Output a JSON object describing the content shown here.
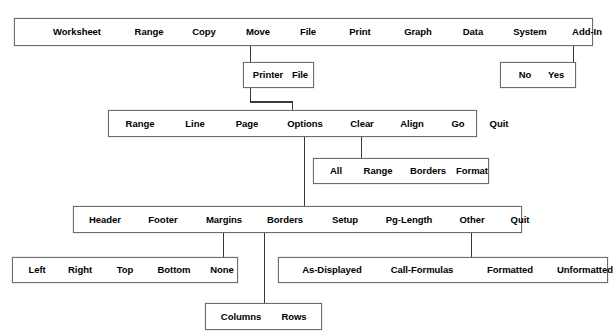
{
  "diagram": {
    "type": "menu-tree",
    "background_color": "#ffffff",
    "line_color": "#3a3a3a",
    "border_color": "#6d6d6d",
    "text_color": "#000000",
    "faint_header": "",
    "rows": [
      {
        "id": "main-menu",
        "name": "main-menu-bar",
        "x": 14,
        "y": 18,
        "width": 579,
        "height": 28,
        "items": [
          {
            "label": "Worksheet",
            "cx": 62
          },
          {
            "label": "Range",
            "cx": 134
          },
          {
            "label": "Copy",
            "cx": 189
          },
          {
            "label": "Move",
            "cx": 243
          },
          {
            "label": "File",
            "cx": 293
          },
          {
            "label": "Print",
            "cx": 345
          },
          {
            "label": "Graph",
            "cx": 403
          },
          {
            "label": "Data",
            "cx": 458
          },
          {
            "label": "System",
            "cx": 515
          },
          {
            "label": "Add-In",
            "cx": 572
          },
          {
            "label": "Quit",
            "cx": 621
          }
        ]
      },
      {
        "id": "print-destination",
        "name": "print-destination-menu",
        "x": 243,
        "y": 62,
        "width": 71,
        "height": 26,
        "items": [
          {
            "label": "Printer",
            "cx": 24
          },
          {
            "label": "File",
            "cx": 56
          }
        ]
      },
      {
        "id": "quit-confirm",
        "name": "quit-confirm-menu",
        "x": 500,
        "y": 62,
        "width": 76,
        "height": 26,
        "items": [
          {
            "label": "No",
            "cx": 24
          },
          {
            "label": "Yes",
            "cx": 55
          }
        ]
      },
      {
        "id": "print-menu",
        "name": "print-settings-menu",
        "x": 108,
        "y": 110,
        "width": 369,
        "height": 27,
        "items": [
          {
            "label": "Range",
            "cx": 31
          },
          {
            "label": "Line",
            "cx": 86
          },
          {
            "label": "Page",
            "cx": 138
          },
          {
            "label": "Options",
            "cx": 196
          },
          {
            "label": "Clear",
            "cx": 253
          },
          {
            "label": "Align",
            "cx": 303
          },
          {
            "label": "Go",
            "cx": 349
          },
          {
            "label": "Quit",
            "cx": 390
          }
        ]
      },
      {
        "id": "clear-menu",
        "name": "clear-submenu",
        "x": 313,
        "y": 158,
        "width": 176,
        "height": 26,
        "items": [
          {
            "label": "All",
            "cx": 22
          },
          {
            "label": "Range",
            "cx": 64
          },
          {
            "label": "Borders",
            "cx": 114
          },
          {
            "label": "Format",
            "cx": 158
          }
        ]
      },
      {
        "id": "options-menu",
        "name": "options-submenu",
        "x": 73,
        "y": 206,
        "width": 449,
        "height": 27,
        "items": [
          {
            "label": "Header",
            "cx": 31
          },
          {
            "label": "Footer",
            "cx": 89
          },
          {
            "label": "Margins",
            "cx": 150
          },
          {
            "label": "Borders",
            "cx": 211
          },
          {
            "label": "Setup",
            "cx": 271
          },
          {
            "label": "Pg-Length",
            "cx": 335
          },
          {
            "label": "Other",
            "cx": 398
          },
          {
            "label": "Quit",
            "cx": 446
          }
        ]
      },
      {
        "id": "borders-margins-menu",
        "name": "margins-submenu",
        "x": 12,
        "y": 257,
        "width": 226,
        "height": 26,
        "items": [
          {
            "label": "Left",
            "cx": 24
          },
          {
            "label": "Right",
            "cx": 67
          },
          {
            "label": "Top",
            "cx": 112
          },
          {
            "label": "Bottom",
            "cx": 161
          },
          {
            "label": "None",
            "cx": 209
          }
        ]
      },
      {
        "id": "other-menu",
        "name": "other-submenu",
        "x": 278,
        "y": 257,
        "width": 330,
        "height": 26,
        "items": [
          {
            "label": "As-Displayed",
            "cx": 53
          },
          {
            "label": "Call-Formulas",
            "cx": 143
          },
          {
            "label": "Formatted",
            "cx": 231
          },
          {
            "label": "Unformatted",
            "cx": 306
          }
        ]
      },
      {
        "id": "borders-menu",
        "name": "borders-submenu",
        "x": 205,
        "y": 303,
        "width": 117,
        "height": 27,
        "items": [
          {
            "label": "Columns",
            "cx": 35
          },
          {
            "label": "Rows",
            "cx": 88
          }
        ]
      }
    ],
    "connectors": [
      {
        "name": "connector-print-to-destination",
        "from": "Print",
        "to": "Printer/File",
        "path": "M 250.5 46 L 250.5 62"
      },
      {
        "name": "connector-destination-to-print-menu",
        "from": "Printer/File",
        "to": "print-settings-menu",
        "path": "M 250.5 88 L 250.5 102 L 292.5 102 L 292.5 110"
      },
      {
        "name": "connector-quit-to-confirm",
        "from": "Quit",
        "to": "No/Yes",
        "path": "M 573.5 46 L 573.5 62"
      },
      {
        "name": "connector-clear-to-submenu",
        "from": "Clear",
        "to": "clear-submenu",
        "path": "M 361.5 137 L 361.5 158"
      },
      {
        "name": "connector-options-to-submenu",
        "from": "Options",
        "to": "options-submenu",
        "path": "M 304.5 137 L 304.5 206"
      },
      {
        "name": "connector-margins-to-submenu",
        "from": "Margins",
        "to": "margins-submenu",
        "path": "M 223.5 233 L 223.5 257"
      },
      {
        "name": "connector-borders-to-submenu",
        "from": "Borders",
        "to": "borders-submenu",
        "path": "M 264.5 233 L 264.5 303"
      },
      {
        "name": "connector-other-to-submenu",
        "from": "Other",
        "to": "other-submenu",
        "path": "M 471.5 233 L 471.5 257"
      }
    ]
  }
}
